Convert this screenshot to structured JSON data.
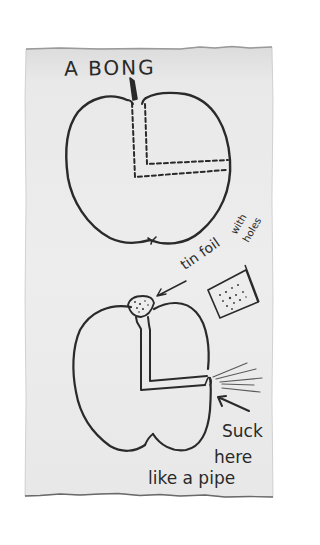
{
  "sketch": {
    "title": "A BONG",
    "annotations": {
      "foil_label_main": "tin foil",
      "foil_label_with": "with",
      "foil_label_holes": "holes",
      "suck_line1": "Suck",
      "suck_line2": "here",
      "suck_line3": "like a pipe"
    },
    "figures": [
      {
        "name": "apple-cross-section",
        "description": "Apple with dashed L-shaped channel cut from the stem down and across to the right side"
      },
      {
        "name": "apple-bong",
        "description": "Apple with foil bowl on top, vertical channel, horizontal channel to mouthpiece on right with smoke lines"
      },
      {
        "name": "foil-square",
        "description": "Square of tin foil punched with holes"
      }
    ],
    "colors": {
      "paper": "#ececec",
      "ink": "#2a2a2a",
      "background": "#ffffff"
    }
  }
}
